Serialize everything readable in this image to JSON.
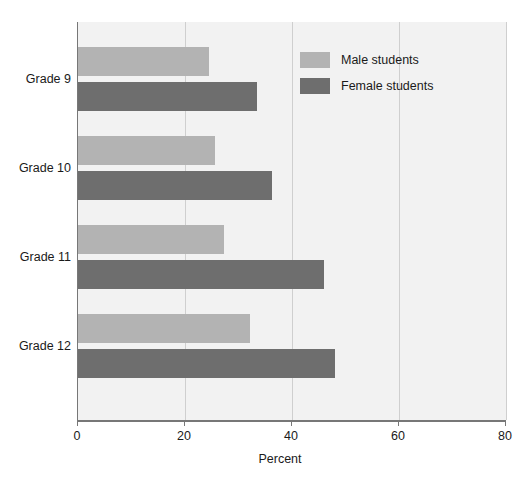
{
  "chart_data": {
    "type": "bar",
    "orientation": "horizontal",
    "title": "",
    "xlabel": "Percent",
    "ylabel": "",
    "xlim": [
      0,
      80
    ],
    "xticks": [
      0,
      20,
      40,
      60,
      80
    ],
    "xtick_labels": [
      "0",
      "20",
      "40",
      "60",
      "80"
    ],
    "categories": [
      "Grade 9",
      "Grade 10",
      "Grade 11",
      "Grade 12"
    ],
    "grid": "vertical",
    "legend_position": "top-right",
    "series": [
      {
        "name": "Male students",
        "color": "#b3b3b3",
        "values": [
          24.4,
          25.6,
          27.3,
          32.1
        ]
      },
      {
        "name": "Female students",
        "color": "#6e6e6e",
        "values": [
          33.5,
          36.3,
          46.0,
          48.0
        ]
      }
    ]
  },
  "legend": {
    "items": [
      {
        "label": "Male students",
        "swatch": "male"
      },
      {
        "label": "Female students",
        "swatch": "female"
      }
    ]
  },
  "colors": {
    "male_bar": "#b3b3b3",
    "female_bar": "#6e6e6e",
    "plot_background": "#f2f2f2",
    "gridline": "#cfcfcf",
    "axis": "#777777",
    "text": "#1a1a1a"
  }
}
